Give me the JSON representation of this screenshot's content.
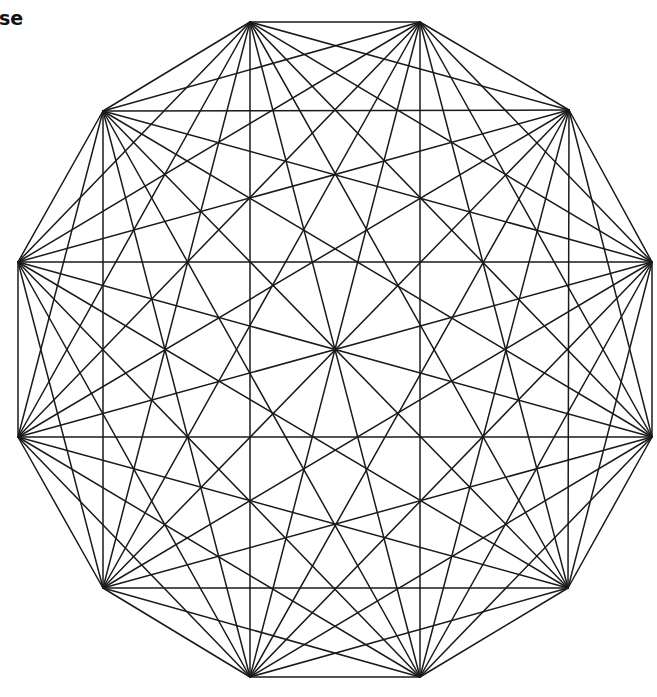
{
  "caption": {
    "text": "se"
  },
  "diagram": {
    "type": "complete-graph",
    "name": "K12 on regular dodecagon",
    "vertex_count": 12,
    "edge_count": 66,
    "stroke_color": "#1a1a1a",
    "background_color": "#ffffff",
    "vertices": [
      {
        "id": 1,
        "x": 250,
        "y": 22
      },
      {
        "id": 2,
        "x": 420,
        "y": 22
      },
      {
        "id": 3,
        "x": 569,
        "y": 110
      },
      {
        "id": 4,
        "x": 652,
        "y": 262
      },
      {
        "id": 5,
        "x": 652,
        "y": 437
      },
      {
        "id": 6,
        "x": 568,
        "y": 588
      },
      {
        "id": 7,
        "x": 420,
        "y": 677
      },
      {
        "id": 8,
        "x": 250,
        "y": 677
      },
      {
        "id": 9,
        "x": 103,
        "y": 588
      },
      {
        "id": 10,
        "x": 18,
        "y": 437
      },
      {
        "id": 11,
        "x": 18,
        "y": 262
      },
      {
        "id": 12,
        "x": 103,
        "y": 111
      }
    ],
    "center": {
      "x": 335,
      "y": 350
    }
  }
}
